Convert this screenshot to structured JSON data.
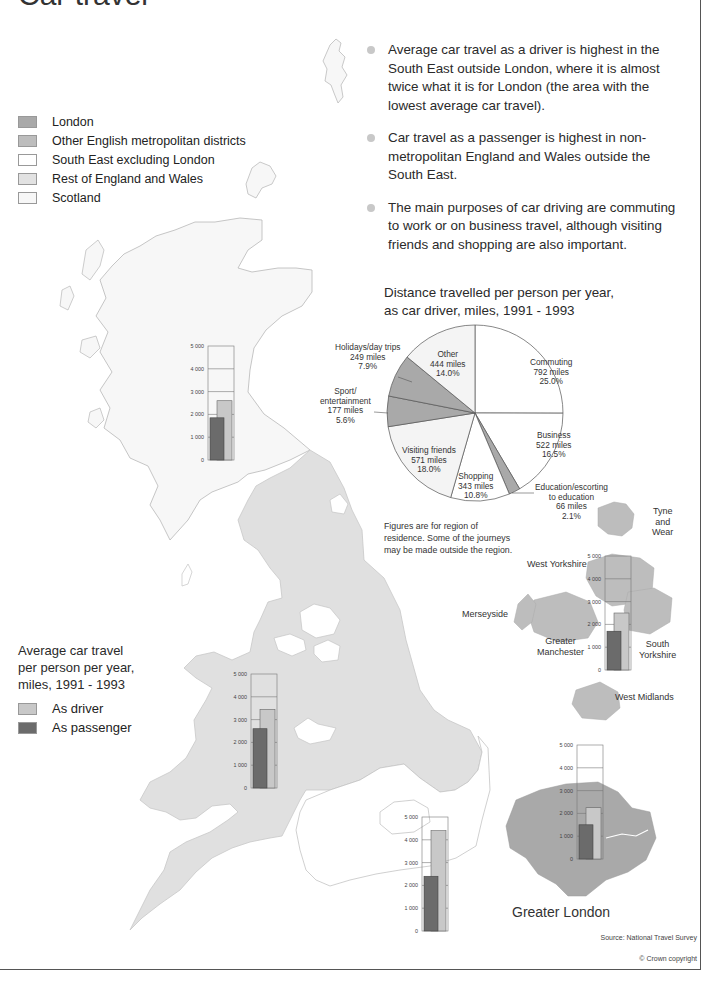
{
  "page": {
    "title": "Car travel",
    "source": "Source: National Travel Survey",
    "copyright": "© Crown copyright"
  },
  "region_legend": {
    "items": [
      {
        "label": "London",
        "color": "#a9a9a9"
      },
      {
        "label": "Other English metropolitan districts",
        "color": "#bdbdbd"
      },
      {
        "label": "South East excluding London",
        "color": "#ffffff"
      },
      {
        "label": "Rest of England and Wales",
        "color": "#e2e2e2"
      },
      {
        "label": "Scotland",
        "color": "#f7f7f7"
      }
    ]
  },
  "bullets": [
    "Average car travel as a driver is highest in the South East outside London, where it is almost twice what it is for London (the area with the lowest average car travel).",
    "Car travel as a passenger is highest in non-metropolitan England and Wales outside the South East.",
    "The main purposes of car driving are commuting to work or on business travel, although visiting friends and shopping are also important."
  ],
  "pie": {
    "title_line1": "Distance travelled per person per year,",
    "title_line2": "as car driver, miles, 1991 - 1993",
    "footnote_lines": [
      "Figures are for region of",
      "residence. Some of the journeys",
      "may be made outside the region."
    ]
  },
  "avg_legend": {
    "title_lines": [
      "Average car travel",
      "per person per year,",
      "miles, 1991 - 1993"
    ],
    "driver_label": "As driver",
    "passenger_label": "As passenger",
    "driver_color": "#c8c8c8",
    "passenger_color": "#6b6b6b"
  },
  "metro_labels": {
    "tyne": [
      "Tyne",
      "and",
      "Wear"
    ],
    "west_yorkshire": "West Yorkshire",
    "merseyside": "Merseyside",
    "greater_manchester": [
      "Greater",
      "Manchester"
    ],
    "south_yorkshire": [
      "South",
      "Yorkshire"
    ],
    "west_midlands": "West Midlands"
  },
  "london_caption": "Greater London",
  "chart_data": [
    {
      "type": "pie",
      "title": "Distance travelled per person per year, as car driver, miles, 1991 - 1993",
      "categories": [
        "Commuting",
        "Business",
        "Education/escorting to education",
        "Shopping",
        "Visiting friends",
        "Sport/entertainment",
        "Holidays/day trips",
        "Other"
      ],
      "values": [
        792,
        522,
        66,
        343,
        571,
        177,
        249,
        444
      ],
      "percentages": [
        25.0,
        16.5,
        2.1,
        10.8,
        18.0,
        5.6,
        7.9,
        14.0
      ],
      "unit": "miles",
      "colors": [
        "#ffffff",
        "#ffffff",
        "#a9a9a9",
        "#ffffff",
        "#f4f4f4",
        "#a9a9a9",
        "#a9a9a9",
        "#f4f4f4"
      ],
      "labels": [
        {
          "lines": [
            "Commuting",
            "792 miles",
            "25.0%"
          ]
        },
        {
          "lines": [
            "Business",
            "522 miles",
            "16.5%"
          ]
        },
        {
          "lines": [
            "Education/escorting",
            "to education",
            "66 miles",
            "2.1%"
          ]
        },
        {
          "lines": [
            "Shopping",
            "343 miles",
            "10.8%"
          ]
        },
        {
          "lines": [
            "Visiting friends",
            "571 miles",
            "18.0%"
          ]
        },
        {
          "lines": [
            "Sport/",
            "entertainment",
            "177 miles",
            "5.6%"
          ]
        },
        {
          "lines": [
            "Holidays/day trips",
            "249 miles",
            "7.9%"
          ]
        },
        {
          "lines": [
            "Other",
            "444 miles",
            "14.0%"
          ]
        }
      ]
    },
    {
      "type": "bar",
      "title": "Average car travel per person per year, miles, 1991 - 1993",
      "categories": [
        "Scotland",
        "Rest of England and Wales",
        "South East excluding London",
        "Other English metropolitan districts",
        "London"
      ],
      "series": [
        {
          "name": "As driver",
          "values": [
            2600,
            3450,
            4400,
            2500,
            2250
          ]
        },
        {
          "name": "As passenger",
          "values": [
            1850,
            2600,
            2400,
            1700,
            1500
          ]
        }
      ],
      "ylabel": "miles",
      "ylim": [
        0,
        5000
      ],
      "yticks": [
        "0",
        "1 000",
        "2 000",
        "3 000",
        "4 000",
        "5 000"
      ],
      "grid": true
    }
  ]
}
